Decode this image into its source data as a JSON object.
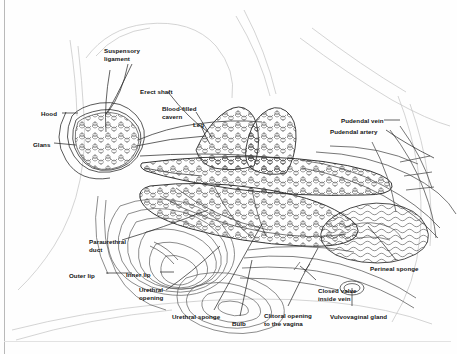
{
  "figure": {
    "type": "anatomical-line-diagram",
    "style": "black-and-white line drawing with cellular erectile-tissue shading",
    "border_color": "#b9b9b9",
    "ink_color": "#2b2b2b",
    "background_color": "#fefefe"
  },
  "labels": [
    {
      "id": "suspensory-ligament",
      "text": "Suspensory\nligament",
      "x": 104,
      "y": 47,
      "align": "left"
    },
    {
      "id": "erect-shaft",
      "text": "Erect shaft",
      "x": 140,
      "y": 88,
      "align": "left"
    },
    {
      "id": "blood-filled-cavern",
      "text": "Blood-filled\ncavern",
      "x": 162,
      "y": 105,
      "align": "left"
    },
    {
      "id": "leg",
      "text": "Leg",
      "x": 193,
      "y": 121,
      "align": "left"
    },
    {
      "id": "hood",
      "text": "Hood",
      "x": 41,
      "y": 110,
      "align": "left"
    },
    {
      "id": "glans",
      "text": "Glans",
      "x": 33,
      "y": 141,
      "align": "left"
    },
    {
      "id": "pudendal-vein",
      "text": "Pudendal vein",
      "x": 341,
      "y": 117,
      "align": "left"
    },
    {
      "id": "pudendal-artery",
      "text": "Pudendal artery",
      "x": 330,
      "y": 128,
      "align": "left"
    },
    {
      "id": "paraurethral-duct",
      "text": "Paraurethral\nduct",
      "x": 89,
      "y": 238,
      "align": "left"
    },
    {
      "id": "outer-lip",
      "text": "Outer lip",
      "x": 69,
      "y": 272,
      "align": "left"
    },
    {
      "id": "inner-lip",
      "text": "Inner lip",
      "x": 126,
      "y": 271,
      "align": "left"
    },
    {
      "id": "urethral-opening",
      "text": "Urethral\nopening",
      "x": 139,
      "y": 286,
      "align": "left"
    },
    {
      "id": "urethral-sponge",
      "text": "Urethral sponge",
      "x": 172,
      "y": 313,
      "align": "left"
    },
    {
      "id": "bulb",
      "text": "Bulb",
      "x": 232,
      "y": 320,
      "align": "left"
    },
    {
      "id": "clitoral-opening-to-the-vagina",
      "text": "Clitoral opening\nto the vagina",
      "x": 264,
      "y": 312,
      "align": "left"
    },
    {
      "id": "closed-valve-inside-vein",
      "text": "Closed valve\ninside vein",
      "x": 318,
      "y": 287,
      "align": "left"
    },
    {
      "id": "vulvovaginal-gland",
      "text": "Vulvovaginal gland",
      "x": 330,
      "y": 313,
      "align": "left"
    },
    {
      "id": "perineal-sponge",
      "text": "Perineal sponge",
      "x": 370,
      "y": 265,
      "align": "left"
    }
  ]
}
